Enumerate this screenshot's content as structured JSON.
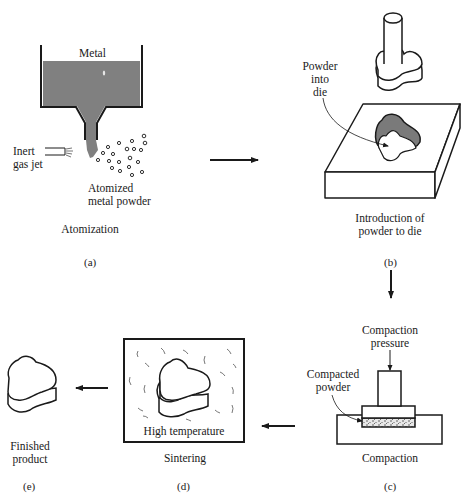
{
  "colors": {
    "line": "#1a1a1a",
    "metal": "#808080",
    "background": "#ffffff"
  },
  "steps": [
    {
      "id": "a",
      "tag": "(a)",
      "caption": "Atomization",
      "labels": {
        "metal": "Metal",
        "gas_jet_1": "Inert",
        "gas_jet_2": "gas jet",
        "powder_1": "Atomized",
        "powder_2": "metal powder"
      }
    },
    {
      "id": "b",
      "tag": "(b)",
      "caption_1": "Introduction of",
      "caption_2": "powder to die",
      "labels": {
        "powder_1": "Powder",
        "powder_2": "into",
        "powder_3": "die"
      }
    },
    {
      "id": "c",
      "tag": "(c)",
      "caption": "Compaction",
      "labels": {
        "pressure_1": "Compaction",
        "pressure_2": "pressure",
        "compacted_1": "Compacted",
        "compacted_2": "powder"
      }
    },
    {
      "id": "d",
      "tag": "(d)",
      "caption": "Sintering",
      "labels": {
        "temp": "High temperature"
      }
    },
    {
      "id": "e",
      "tag": "(e)",
      "caption_1": "Finished",
      "caption_2": "product"
    }
  ],
  "flow": [
    "a → b",
    "b → c",
    "c → d",
    "d → e"
  ]
}
